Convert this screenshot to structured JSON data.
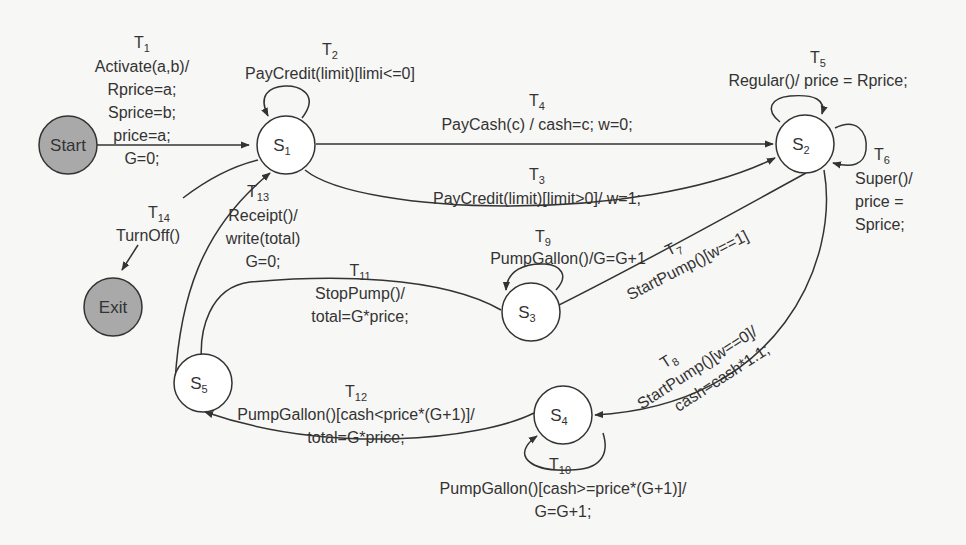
{
  "diagram": {
    "type": "state-machine",
    "colors": {
      "terminal_fill": "#a9a9a9",
      "state_fill": "#ffffff",
      "line": "#333333",
      "background": "#f7f7f5"
    },
    "nodes": {
      "start": {
        "label": "Start",
        "kind": "terminal"
      },
      "exit": {
        "label": "Exit",
        "kind": "terminal"
      },
      "s1": {
        "label": "S",
        "sub": "1"
      },
      "s2": {
        "label": "S",
        "sub": "2"
      },
      "s3": {
        "label": "S",
        "sub": "3"
      },
      "s4": {
        "label": "S",
        "sub": "4"
      },
      "s5": {
        "label": "S",
        "sub": "5"
      }
    },
    "transitions": {
      "t1": {
        "id": "T",
        "sub": "1",
        "from": "Start",
        "to": "S1",
        "lines": [
          "Activate(a,b)/",
          "Rprice=a;",
          "Sprice=b;",
          "price=a;",
          "G=0;"
        ]
      },
      "t2": {
        "id": "T",
        "sub": "2",
        "from": "S1",
        "to": "S1",
        "lines": [
          "PayCredit(limit)[limi<=0]"
        ]
      },
      "t3": {
        "id": "T",
        "sub": "3",
        "from": "S1",
        "to": "S2",
        "lines": [
          "PayCredit(limit)[limit>0]/ w=1;"
        ]
      },
      "t4": {
        "id": "T",
        "sub": "4",
        "from": "S1",
        "to": "S2",
        "lines": [
          "PayCash(c) / cash=c; w=0;"
        ]
      },
      "t5": {
        "id": "T",
        "sub": "5",
        "from": "S2",
        "to": "S2",
        "lines": [
          "Regular()/ price = Rprice;"
        ]
      },
      "t6": {
        "id": "T",
        "sub": "6",
        "from": "S2",
        "to": "S2",
        "lines": [
          "Super()/",
          "price =",
          "Sprice;"
        ]
      },
      "t7": {
        "id": "T",
        "sub": "7",
        "from": "S2",
        "to": "S3",
        "lines": [
          "StartPump()[w==1]"
        ]
      },
      "t8": {
        "id": "T",
        "sub": "8",
        "from": "S2",
        "to": "S4",
        "lines": [
          "StartPump()[w==0]/",
          "cash=cash*1.1;"
        ]
      },
      "t9": {
        "id": "T",
        "sub": "9",
        "from": "S3",
        "to": "S3",
        "lines": [
          "PumpGallon()/G=G+1"
        ]
      },
      "t10": {
        "id": "T",
        "sub": "10",
        "from": "S4",
        "to": "S4",
        "lines": [
          "PumpGallon()[cash>=price*(G+1)]/",
          "G=G+1;"
        ]
      },
      "t11": {
        "id": "T",
        "sub": "11",
        "from": "S3",
        "to": "S5",
        "lines": [
          "StopPump()/",
          "total=G*price;"
        ]
      },
      "t12": {
        "id": "T",
        "sub": "12",
        "from": "S4",
        "to": "S5",
        "lines": [
          "PumpGallon()[cash<price*(G+1)]/",
          "total=G*price;"
        ]
      },
      "t13": {
        "id": "T",
        "sub": "13",
        "from": "S5",
        "to": "S1",
        "lines": [
          "Receipt()/",
          "write(total)",
          "G=0;"
        ]
      },
      "t14": {
        "id": "T",
        "sub": "14",
        "from": "S1",
        "to": "Exit",
        "lines": [
          "TurnOff()"
        ]
      }
    }
  }
}
